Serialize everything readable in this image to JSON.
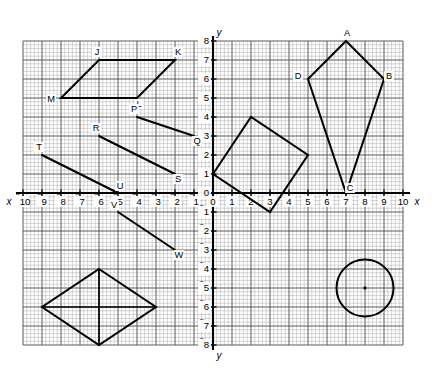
{
  "figure": {
    "axis_labels": {
      "x": "x",
      "y": "y",
      "x_negative": "x",
      "y_negative": "y"
    },
    "grid": {
      "x_min": -10,
      "x_max": 10,
      "y_min": -8,
      "y_max": 8,
      "unit_px": 19.0,
      "minor_per_unit": 5,
      "origin_px": {
        "x": 213.0,
        "y": 193.0
      },
      "minor_color": "#9a9a9a",
      "major_color": "#4a4a4a",
      "axis_color": "#000000"
    },
    "x_ticks": [
      {
        "value": -10,
        "label": "10",
        "negative": true
      },
      {
        "value": -9,
        "label": "9",
        "negative": true
      },
      {
        "value": -8,
        "label": "8",
        "negative": true
      },
      {
        "value": -7,
        "label": "7",
        "negative": true
      },
      {
        "value": -6,
        "label": "6",
        "negative": true
      },
      {
        "value": -5,
        "label": "5",
        "negative": true
      },
      {
        "value": -4,
        "label": "4",
        "negative": true
      },
      {
        "value": -3,
        "label": "3",
        "negative": true
      },
      {
        "value": -2,
        "label": "2",
        "negative": true
      },
      {
        "value": -1,
        "label": "1",
        "negative": true
      },
      {
        "value": 0,
        "label": "0",
        "negative": false
      },
      {
        "value": 1,
        "label": "1",
        "negative": false
      },
      {
        "value": 2,
        "label": "2",
        "negative": false
      },
      {
        "value": 3,
        "label": "3",
        "negative": false
      },
      {
        "value": 4,
        "label": "4",
        "negative": false
      },
      {
        "value": 5,
        "label": "5",
        "negative": false
      },
      {
        "value": 6,
        "label": "6",
        "negative": false
      },
      {
        "value": 7,
        "label": "7",
        "negative": false
      },
      {
        "value": 8,
        "label": "8",
        "negative": false
      },
      {
        "value": 9,
        "label": "9",
        "negative": false
      },
      {
        "value": 10,
        "label": "10",
        "negative": false
      }
    ],
    "y_ticks": [
      {
        "value": 8,
        "label": "8",
        "negative": false
      },
      {
        "value": 7,
        "label": "7",
        "negative": false
      },
      {
        "value": 6,
        "label": "6",
        "negative": false
      },
      {
        "value": 5,
        "label": "5",
        "negative": false
      },
      {
        "value": 4,
        "label": "4",
        "negative": false
      },
      {
        "value": 3,
        "label": "3",
        "negative": false
      },
      {
        "value": 2,
        "label": "2",
        "negative": false
      },
      {
        "value": 1,
        "label": "1",
        "negative": false
      },
      {
        "value": 0,
        "label": "0",
        "negative": false
      },
      {
        "value": -1,
        "label": "1",
        "negative": true
      },
      {
        "value": -2,
        "label": "2",
        "negative": true
      },
      {
        "value": -3,
        "label": "3",
        "negative": true
      },
      {
        "value": -4,
        "label": "4",
        "negative": true
      },
      {
        "value": -5,
        "label": "5",
        "negative": true
      },
      {
        "value": -6,
        "label": "6",
        "negative": true
      },
      {
        "value": -7,
        "label": "7",
        "negative": true
      },
      {
        "value": -8,
        "label": "8",
        "negative": true
      }
    ],
    "shapes": [
      {
        "name": "parallelogram-jklm",
        "kind": "polygon",
        "closed": true,
        "points": [
          [
            -6,
            7
          ],
          [
            -2,
            7
          ],
          [
            -4,
            5
          ],
          [
            -8,
            5
          ]
        ],
        "vertex_labels": [
          {
            "text": "J",
            "x": -6,
            "y": 7,
            "dx": -2,
            "dy": -5
          },
          {
            "text": "K",
            "x": -2,
            "y": 7,
            "dx": 3,
            "dy": -5
          },
          {
            "text": "L",
            "x": -4,
            "y": 5,
            "dx": 2,
            "dy": 9
          },
          {
            "text": "M",
            "x": -8,
            "y": 5,
            "dx": -10,
            "dy": 4
          }
        ]
      },
      {
        "name": "kite-abcd",
        "kind": "polygon",
        "closed": true,
        "points": [
          [
            7,
            8
          ],
          [
            9,
            6
          ],
          [
            7,
            0
          ],
          [
            5,
            6
          ]
        ],
        "vertex_labels": [
          {
            "text": "A",
            "x": 7,
            "y": 8,
            "dx": 1,
            "dy": -5
          },
          {
            "text": "B",
            "x": 9,
            "y": 6,
            "dx": 5,
            "dy": 0
          },
          {
            "text": "C",
            "x": 7,
            "y": 0,
            "dx": 4,
            "dy": -2
          },
          {
            "text": "D",
            "x": 5,
            "y": 6,
            "dx": -10,
            "dy": 0
          }
        ]
      },
      {
        "name": "tilted-square",
        "kind": "polygon",
        "closed": true,
        "points": [
          [
            0,
            1
          ],
          [
            2,
            4
          ],
          [
            5,
            2
          ],
          [
            3,
            -1
          ]
        ],
        "vertex_labels": []
      },
      {
        "name": "rhombus-with-diagonals",
        "kind": "polygon",
        "closed": true,
        "points": [
          [
            -6,
            -4
          ],
          [
            -3,
            -6
          ],
          [
            -6,
            -8
          ],
          [
            -9,
            -6
          ]
        ],
        "vertex_labels": []
      },
      {
        "name": "rhombus-diagonal-vertical",
        "kind": "segment",
        "points": [
          [
            -6,
            -4
          ],
          [
            -6,
            -8
          ]
        ],
        "vertex_labels": []
      },
      {
        "name": "rhombus-diagonal-horizontal",
        "kind": "segment",
        "points": [
          [
            -9,
            -6
          ],
          [
            -3,
            -6
          ]
        ],
        "vertex_labels": []
      },
      {
        "name": "circle-figure",
        "kind": "circle",
        "center": [
          8,
          -5
        ],
        "radius": 1.5,
        "show_center_dot": true,
        "vertex_labels": []
      }
    ],
    "segments": [
      {
        "name": "segment-pq",
        "points": [
          [
            -4,
            4
          ],
          [
            -1,
            3
          ]
        ],
        "vertex_labels": [
          {
            "text": "P",
            "x": -4,
            "y": 4,
            "dx": -3,
            "dy": -5
          },
          {
            "text": "Q",
            "x": -1,
            "y": 3,
            "dx": 3,
            "dy": 8
          }
        ]
      },
      {
        "name": "segment-rs",
        "points": [
          [
            -6,
            3
          ],
          [
            -2,
            1
          ]
        ],
        "vertex_labels": [
          {
            "text": "R",
            "x": -6,
            "y": 3,
            "dx": -3,
            "dy": -5
          },
          {
            "text": "S",
            "x": -2,
            "y": 1,
            "dx": 3,
            "dy": 8
          }
        ]
      },
      {
        "name": "segment-tu",
        "points": [
          [
            -9,
            2
          ],
          [
            -5,
            0
          ]
        ],
        "vertex_labels": [
          {
            "text": "T",
            "x": -9,
            "y": 2,
            "dx": -3,
            "dy": -5
          },
          {
            "text": "U",
            "x": -5,
            "y": 0,
            "dx": 2,
            "dy": -4
          }
        ]
      },
      {
        "name": "segment-vw",
        "points": [
          [
            -5,
            -1
          ],
          [
            -2,
            -3
          ]
        ],
        "vertex_labels": [
          {
            "text": "V",
            "x": -5,
            "y": -1,
            "dx": -4,
            "dy": -4
          },
          {
            "text": "W",
            "x": -2,
            "y": -3,
            "dx": 4,
            "dy": 8
          }
        ]
      }
    ]
  }
}
